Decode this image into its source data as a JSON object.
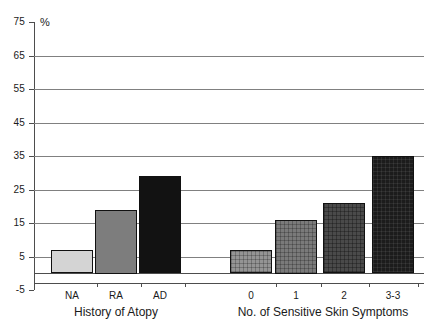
{
  "chart_data": {
    "type": "bar",
    "title": "",
    "xlabel": "",
    "ylabel": "%",
    "ylim": [
      -5,
      75
    ],
    "grid": true,
    "legend": "none",
    "y_ticks": [
      75,
      65,
      55,
      45,
      35,
      25,
      15,
      5,
      -5
    ],
    "y_tick_labels": [
      "75",
      "65",
      "55",
      "45",
      "35",
      "25",
      "15",
      "5",
      "-5"
    ],
    "groups": [
      {
        "name": "History of Atopy",
        "axis_title": "History of Atopy",
        "categories": [
          "NA",
          "RA",
          "AD"
        ],
        "values": [
          7,
          19,
          29
        ],
        "fills": [
          "light-gray-solid",
          "medium-gray-solid",
          "black-solid"
        ]
      },
      {
        "name": "No. of Sensitive Skin Symptoms",
        "axis_title": "No. of Sensitive Skin Symptoms",
        "categories": [
          "0",
          "1",
          "2",
          "3-3"
        ],
        "values": [
          7,
          16,
          21,
          35
        ],
        "fills": [
          "gray-crosshatch",
          "dark-gray-crosshatch",
          "darker-gray-crosshatch",
          "black-crosshatch"
        ]
      }
    ],
    "colors": {
      "na": "#d4d4d4",
      "ra": "#7d7d7d",
      "ad": "#121212",
      "s0": "#949494",
      "s1": "#7a7a7a",
      "s2": "#4a4a4a",
      "s3": "#1c1c1c",
      "grid": "#808080",
      "axis": "#4d4d4d",
      "text": "#1a1a1a"
    }
  }
}
